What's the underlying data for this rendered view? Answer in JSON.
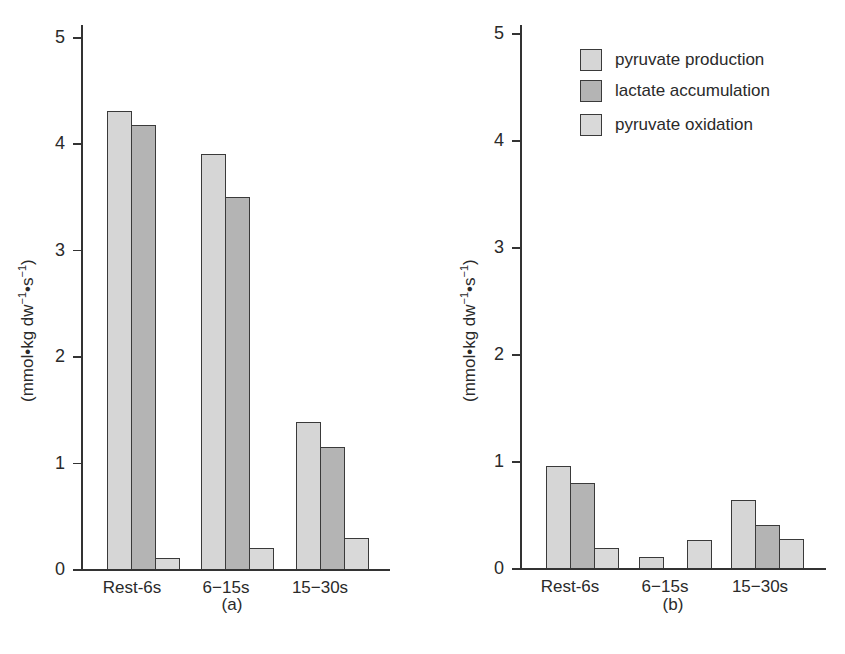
{
  "chart_data": [
    {
      "type": "bar",
      "panel": "(a)",
      "title": "",
      "xlabel": "",
      "ylabel": "(mmol•kg dw⁻¹•s⁻¹)",
      "ylim": [
        0,
        5
      ],
      "yticks": [
        0,
        1,
        2,
        3,
        4,
        5
      ],
      "categories": [
        "Rest-6s",
        "6−15s",
        "15−30s"
      ],
      "series": [
        {
          "name": "pyruvate production",
          "values": [
            4.3,
            3.9,
            1.38
          ]
        },
        {
          "name": "lactate accumulation",
          "values": [
            4.17,
            3.5,
            1.15
          ]
        },
        {
          "name": "pyruvate oxidation",
          "values": [
            0.1,
            0.2,
            0.29
          ]
        }
      ],
      "grid": false,
      "legend_position": "none"
    },
    {
      "type": "bar",
      "panel": "(b)",
      "title": "",
      "xlabel": "",
      "ylabel": "(mmol•kg dw⁻¹•s⁻¹)",
      "ylim": [
        0,
        5
      ],
      "yticks": [
        0,
        1,
        2,
        3,
        4,
        5
      ],
      "categories": [
        "Rest-6s",
        "6−15s",
        "15−30s"
      ],
      "series": [
        {
          "name": "pyruvate production",
          "values": [
            0.95,
            0.1,
            0.64
          ]
        },
        {
          "name": "lactate accumulation",
          "values": [
            0.79,
            0,
            0.4
          ]
        },
        {
          "name": "pyruvate oxidation",
          "values": [
            0.19,
            0.26,
            0.27
          ]
        }
      ],
      "grid": false,
      "legend_position": "upper right"
    }
  ],
  "labels": {
    "ylabel_main": "(mmol•kg dw",
    "ylabel_exp1": "−1",
    "ylabel_mid": "•s",
    "ylabel_exp2": "−1",
    "ylabel_end": ")",
    "panel_a": "(a)",
    "panel_b": "(b)",
    "ticks": [
      "0",
      "1",
      "2",
      "3",
      "4",
      "5"
    ]
  },
  "legend": [
    {
      "label": "pyruvate production",
      "color": "#d6d6d6"
    },
    {
      "label": "lactate accumulation",
      "color": "#b4b4b4"
    },
    {
      "label": "pyruvate oxidation",
      "color": "#d9d9d9"
    }
  ],
  "colors": {
    "production": "#d6d6d6",
    "lactate": "#b4b4b4",
    "oxidation": "#d9d9d9",
    "axis": "#333333"
  }
}
